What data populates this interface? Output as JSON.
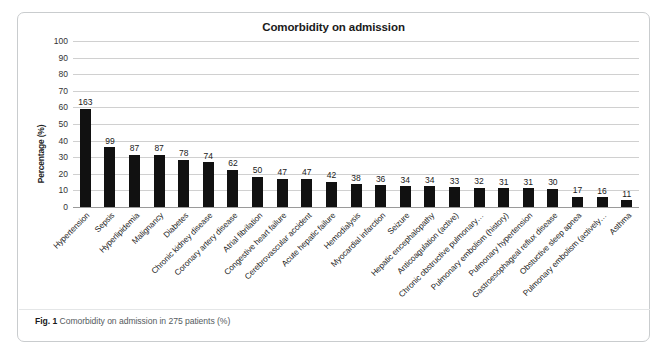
{
  "figure": {
    "caption_number": "Fig. 1",
    "caption_text": "Comorbidity on admission in 275 patients (%)"
  },
  "chart_data": {
    "type": "bar",
    "title": "Comorbidity on admission",
    "xlabel": "",
    "ylabel": "Percentage (%)",
    "ylim": [
      0,
      100
    ],
    "ytick_labels": [
      "100",
      "90",
      "80",
      "70",
      "60",
      "50",
      "40",
      "30",
      "20",
      "10",
      "0"
    ],
    "yticks": [
      100,
      90,
      80,
      70,
      60,
      50,
      40,
      30,
      20,
      10,
      0
    ],
    "grid": true,
    "legend": "none",
    "total_patients": 275,
    "bar_color": "#111111",
    "gridline_color": "#d0d0d0",
    "categories": [
      "Hypertension",
      "Sepsis",
      "Hyperlipidemia",
      "Malignancy",
      "Diabetes",
      "Chronic kidney disease",
      "Coronary artery disease",
      "Atrial fibrilation",
      "Congestive heart failure",
      "Cerebrovascular accident",
      "Acute hepatic failure",
      "Hemodialysis",
      "Myocardial infarction",
      "Seizure",
      "Hepatic encephalopathy",
      "Anticoagulation (active)",
      "Chronic obstructive pulmonary…",
      "Pulmonary embolism (history)",
      "Pulmonary hypertension",
      "Gastroesophageal reflux disease",
      "Obstuctive sleep apnea",
      "Pulmonary embolism (actively…",
      "Asthma"
    ],
    "data_labels": [
      163,
      99,
      87,
      87,
      78,
      74,
      62,
      50,
      47,
      47,
      42,
      38,
      36,
      34,
      34,
      33,
      32,
      31,
      31,
      30,
      17,
      16,
      11
    ],
    "values": [
      59.3,
      36.0,
      31.6,
      31.6,
      28.4,
      26.9,
      22.5,
      18.2,
      17.1,
      17.1,
      15.3,
      13.8,
      13.1,
      12.4,
      12.4,
      12.0,
      11.6,
      11.3,
      11.3,
      10.9,
      6.2,
      5.8,
      4.0
    ]
  }
}
